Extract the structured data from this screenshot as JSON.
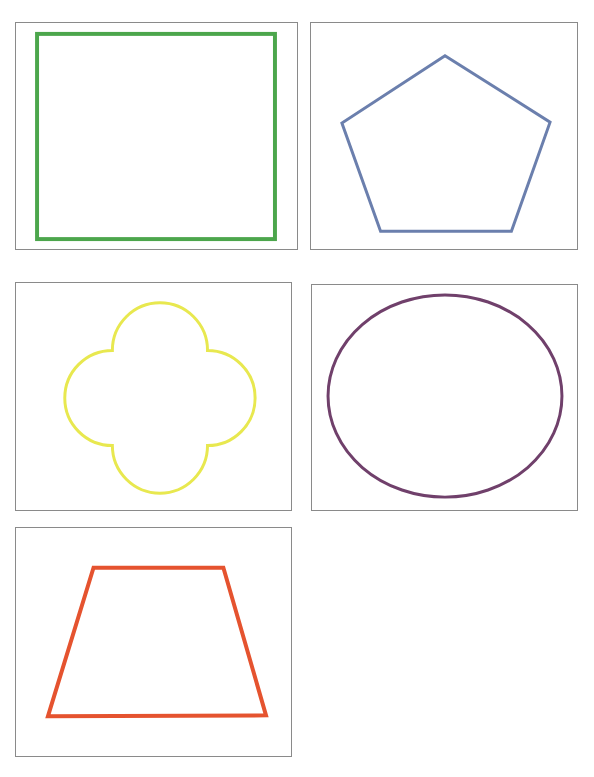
{
  "canvas": {
    "width": 594,
    "height": 777,
    "background": "#ffffff",
    "panel_border_color": "#8a8a8a",
    "panel_border_width": 1,
    "description": "Grid of five bordered panels, each containing one geometric shape outline"
  },
  "panels": [
    {
      "id": "panel-square",
      "index": 1,
      "shape_name": "square",
      "color": "#4ca64c",
      "stroke_width": 4,
      "frame": {
        "x": 15,
        "y": 22,
        "width": 283,
        "height": 228
      },
      "geometry": {
        "type": "rect",
        "x": 36,
        "y": 33,
        "width": 240,
        "height": 207
      }
    },
    {
      "id": "panel-pentagon",
      "index": 2,
      "shape_name": "pentagon",
      "color": "#6b7fad",
      "stroke_width": 3,
      "frame": {
        "x": 310,
        "y": 22,
        "width": 268,
        "height": 228
      },
      "geometry": {
        "type": "polygon",
        "points": "445,55 551,122 512,232 380,232 341,123"
      }
    },
    {
      "id": "panel-quatrefoil",
      "index": 3,
      "shape_name": "quatrefoil",
      "color": "#e8e84f",
      "stroke_width": 3,
      "frame": {
        "x": 15,
        "y": 282,
        "width": 277,
        "height": 229
      },
      "geometry": {
        "type": "path",
        "d": "M 160 302 A 48 48 0 0 1 208 350 A 48 48 0 0 1 256 398 A 48 48 0 0 1 208 446 A 48 48 0 0 1 160 494 A 48 48 0 0 1 112 446 A 48 48 0 0 1 64 398 A 48 48 0 0 1 112 350 A 48 48 0 0 1 160 302 Z"
      }
    },
    {
      "id": "panel-ellipse",
      "index": 4,
      "shape_name": "ellipse",
      "color": "#70406b",
      "stroke_width": 3,
      "frame": {
        "x": 311,
        "y": 284,
        "width": 267,
        "height": 227
      },
      "geometry": {
        "type": "ellipse",
        "cx": 445,
        "cy": 396,
        "rx": 118,
        "ry": 102
      }
    },
    {
      "id": "panel-trapezoid",
      "index": 5,
      "shape_name": "trapezoid",
      "color": "#e5532f",
      "stroke_width": 4,
      "frame": {
        "x": 15,
        "y": 527,
        "width": 277,
        "height": 230
      },
      "geometry": {
        "type": "polygon",
        "points": "93,567 224,567 267,716 47,717"
      }
    }
  ]
}
